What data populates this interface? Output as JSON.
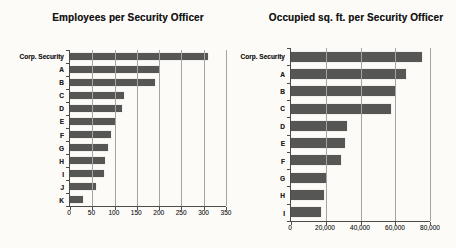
{
  "chart_data": [
    {
      "type": "bar",
      "orientation": "horizontal",
      "title": "Employees per Security Officer",
      "xlabel": "",
      "ylabel": "",
      "categories": [
        "Corp. Security",
        "A",
        "B",
        "C",
        "D",
        "E",
        "F",
        "G",
        "H",
        "I",
        "J",
        "K"
      ],
      "values": [
        310,
        200,
        190,
        122,
        116,
        100,
        92,
        85,
        78,
        76,
        58,
        30
      ],
      "xlim": [
        0,
        350
      ],
      "xticks": [
        0,
        50,
        100,
        150,
        200,
        250,
        300,
        350
      ],
      "xtick_labels": [
        "0",
        "50",
        "100",
        "150",
        "200",
        "250",
        "300",
        "350"
      ],
      "grid": true,
      "legend": false,
      "bar_color": "#565654"
    },
    {
      "type": "bar",
      "orientation": "horizontal",
      "title": "Occupied sq. ft. per Security Officer",
      "xlabel": "",
      "ylabel": "",
      "categories": [
        "Corp. Security",
        "A",
        "B",
        "C",
        "D",
        "E",
        "F",
        "G",
        "H",
        "I"
      ],
      "values": [
        75500,
        66000,
        60000,
        57500,
        32000,
        31000,
        29000,
        20000,
        19000,
        17500
      ],
      "xlim": [
        0,
        80000
      ],
      "xticks": [
        0,
        20000,
        40000,
        60000,
        80000
      ],
      "xtick_labels": [
        "0",
        "20,000",
        "40,000",
        "60,000",
        "80,000"
      ],
      "grid": true,
      "legend": false,
      "bar_color": "#565654"
    }
  ]
}
